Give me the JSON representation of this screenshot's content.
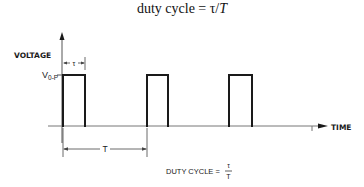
{
  "title": {
    "prefix": "duty cycle = τ/",
    "italic_part": "T"
  },
  "axes": {
    "y_label": "VOLTAGE",
    "x_label": "TIME",
    "level_label": "V",
    "level_subscript": "0-P"
  },
  "dimensions": {
    "pulse_width_symbol": "τ",
    "period_symbol": "T"
  },
  "formula": {
    "label": "DUTY CYCLE =",
    "numerator": "τ",
    "denominator": "T"
  },
  "pulses": [
    {
      "start_x": 63,
      "end_x": 85
    },
    {
      "start_x": 147,
      "end_x": 168
    },
    {
      "start_x": 229,
      "end_x": 252
    }
  ],
  "colors": {
    "line": "#1a1a1a",
    "axis": "#555555",
    "background": "#ffffff"
  }
}
